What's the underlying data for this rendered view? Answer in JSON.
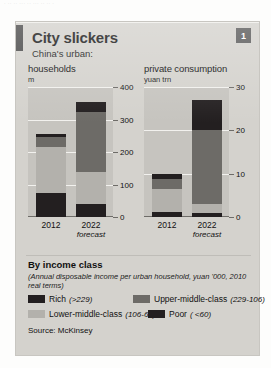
{
  "top_strip": "· ·· ·· ··· ·· ··· ·· ·· ·",
  "card": {
    "title": "City slickers",
    "subtitle": "China's urban:",
    "badge": "1"
  },
  "panels": [
    {
      "key": "households",
      "title": "households",
      "unit": "m",
      "axis": {
        "ticks": [
          "0",
          "100",
          "200",
          "300",
          "400"
        ],
        "max": 400
      },
      "x_categories": [
        "2012",
        "2022"
      ],
      "forecast_label": "forecast"
    },
    {
      "key": "private_consumption",
      "title": "private consumption",
      "unit": "yuan trn",
      "axis": {
        "ticks": [
          "0",
          "10",
          "20",
          "30"
        ],
        "max": 30
      },
      "x_categories": [
        "2012",
        "2022"
      ],
      "forecast_label": "forecast"
    }
  ],
  "legend": {
    "heading": "By income class",
    "note": "(Annual disposable income per urban household, yuan '000, 2010 real terms)",
    "items": [
      {
        "label": "Rich",
        "range": "(>229)",
        "color": "#231f20",
        "key": "rich"
      },
      {
        "label": "Upper-middle-class",
        "range": "(229-106)",
        "color": "#6d6b67",
        "key": "upper"
      },
      {
        "label": "Lower-middle-class",
        "range": "(106-60)",
        "color": "#b3b1ac",
        "key": "lower"
      },
      {
        "label": "Poor",
        "range": "( <60)",
        "color": "#231f20",
        "key": "poor"
      }
    ]
  },
  "source": "Source: McKinsey",
  "chart_data": [
    {
      "type": "bar",
      "stacked": true,
      "title": "households",
      "ylabel": "m",
      "xlabel": "",
      "ylim": [
        0,
        400
      ],
      "yticks": [
        0,
        100,
        200,
        300,
        400
      ],
      "grid": true,
      "categories": [
        "2012",
        "2022 forecast"
      ],
      "series": [
        {
          "name": "Poor ( <60)",
          "values": [
            75,
            40
          ],
          "color": "#231f20"
        },
        {
          "name": "Lower-middle-class (106-60)",
          "values": [
            140,
            100
          ],
          "color": "#b3b1ac"
        },
        {
          "name": "Upper-middle-class (229-106)",
          "values": [
            31,
            182
          ],
          "color": "#6d6b67"
        },
        {
          "name": "Rich (>229)",
          "values": [
            10,
            33
          ],
          "color": "#231f20"
        }
      ],
      "totals": [
        256,
        355
      ]
    },
    {
      "type": "bar",
      "stacked": true,
      "title": "private consumption",
      "ylabel": "yuan trn",
      "xlabel": "",
      "ylim": [
        0,
        30
      ],
      "yticks": [
        0,
        10,
        20,
        30
      ],
      "grid": true,
      "categories": [
        "2012",
        "2022 forecast"
      ],
      "series": [
        {
          "name": "Poor ( <60)",
          "values": [
            1.2,
            1.0
          ],
          "color": "#231f20"
        },
        {
          "name": "Lower-middle-class (106-60)",
          "values": [
            5.3,
            2.0
          ],
          "color": "#b3b1ac"
        },
        {
          "name": "Upper-middle-class (229-106)",
          "values": [
            2.3,
            17.0
          ],
          "color": "#6d6b67"
        },
        {
          "name": "Rich (>229)",
          "values": [
            1.2,
            7.0
          ],
          "color": "#231f20"
        }
      ],
      "totals": [
        10.0,
        27.0
      ]
    }
  ]
}
